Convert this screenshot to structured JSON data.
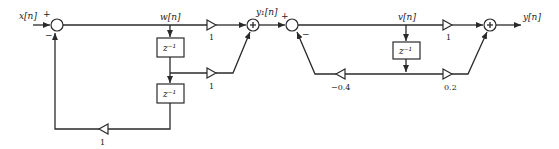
{
  "diagram": {
    "type": "signal-flow block diagram (cascade of FIR-feedback and IIR sections)",
    "signals": {
      "input": "x[n]",
      "w": "w[n]",
      "y1": "y₁[n]",
      "v": "v[n]",
      "output": "y[n]"
    },
    "delay_label": "z⁻¹",
    "sections": [
      {
        "name": "section-1",
        "summing_junction": {
          "plus_sign": "+",
          "minus_sign": "−"
        },
        "gains": {
          "direct": "1",
          "tap1": "1",
          "feedback": "1"
        },
        "adder_symbol": "+"
      },
      {
        "name": "section-2",
        "summing_junction": {
          "plus_sign": "+",
          "minus_sign": "−"
        },
        "gains": {
          "direct": "1",
          "tap1": "0.2",
          "feedback": "−0.4"
        },
        "adder_symbol": "+"
      }
    ]
  }
}
